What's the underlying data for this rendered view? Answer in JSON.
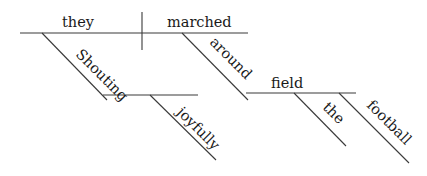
{
  "diagram": {
    "type": "sentence-diagram",
    "style": "Reed-Kellogg",
    "words": {
      "subject": "they",
      "verb": "marched",
      "participle": "Shouting",
      "participle_modifier": "joyfully",
      "preposition": "around",
      "object_of_preposition": "field",
      "article": "the",
      "noun_modifier": "football"
    }
  }
}
